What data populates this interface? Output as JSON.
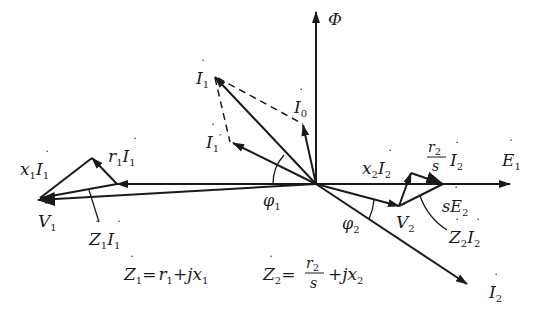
{
  "diagram": {
    "type": "phasor-diagram",
    "labels": {
      "phi": "Φ",
      "E1": "E",
      "E1_sub": "1",
      "I1": "I",
      "I1_sub": "1",
      "I0": "I",
      "I0_sub": "0",
      "I1p": "I",
      "I1p_sub": "1",
      "I1p_prime": "′",
      "I2": "I",
      "I2_sub": "2",
      "V1": "V",
      "V1_sub": "1",
      "V2": "V",
      "V2_sub": "2",
      "x1I1_x": "x",
      "x1I1_xsub": "1",
      "x1I1_I": "I",
      "x1I1_Isub": "1",
      "r1I1_r": "r",
      "r1I1_rsub": "1",
      "r1I1_I": "I",
      "r1I1_Isub": "1",
      "Z1I1_Z": "Z",
      "Z1I1_Zsub": "1",
      "Z1I1_I": "I",
      "Z1I1_Isub": "1",
      "x2I2_x": "x",
      "x2I2_xsub": "2",
      "x2I2_I": "I",
      "x2I2_Isub": "2",
      "r2sI2_num": "r",
      "r2sI2_numsub": "2",
      "r2sI2_den": "s",
      "r2sI2_I": "I",
      "r2sI2_Isub": "2",
      "sE2_s": "s",
      "sE2_E": "E",
      "sE2_sub": "2",
      "Z2I2_Z": "Z",
      "Z2I2_Zsub": "2",
      "Z2I2_I": "I",
      "Z2I2_Isub": "2",
      "phi1": "φ",
      "phi1_sub": "1",
      "phi2": "φ",
      "phi2_sub": "2"
    },
    "equations": {
      "eq1": {
        "lhs": "Z",
        "lhs_sub": "1",
        "eq": "=",
        "t1": "r",
        "t1_sub": "1",
        "plus": "+",
        "t2": "jx",
        "t2_sub": "1"
      },
      "eq2": {
        "lhs": "Z",
        "lhs_sub": "2",
        "eq": "=",
        "num": "r",
        "num_sub": "2",
        "den": "s",
        "plus": "+",
        "t2": "jx",
        "t2_sub": "2"
      }
    },
    "colors": {
      "stroke": "#1a1a1a",
      "background": "#ffffff"
    }
  }
}
